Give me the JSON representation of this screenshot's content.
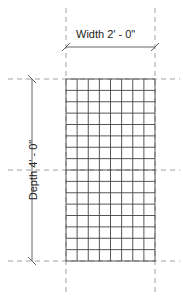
{
  "dimensions": {
    "width_label": "Width 2' - 0\"",
    "depth_label": "Depth 4' - 0\""
  },
  "grid": {
    "columns": 8,
    "rows": 16,
    "left": 66,
    "right": 155,
    "top": 79,
    "bottom": 261,
    "mid_y": 170,
    "line_color": "#444444"
  },
  "colors": {
    "reference_line": "#888888",
    "dimension_line": "#555555"
  }
}
